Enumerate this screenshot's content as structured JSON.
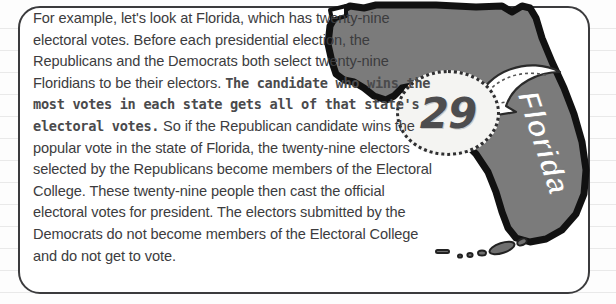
{
  "card": {
    "paragraph_lead": "For example, let's look at Florida, which has twenty-nine electoral votes. Before each presidential election, the Republicans and the Democrats both select twenty-nine Floridians to be their electors. ",
    "paragraph_emphasis": "The candidate who wins the most votes in each state gets all of that state's electoral votes.",
    "paragraph_tail": " So if the Republican candidate wins the popular vote in the state of Florida, the twenty-nine electors selected by the Republicans become members of the Electoral College. These twenty-nine people then cast the official electoral votes for president. The electors submitted by the Democrats do not become members of the Electoral College and do not get to vote."
  },
  "callout": {
    "electoral_votes": "29"
  },
  "map": {
    "state_label": "Florida",
    "fill_color": "#7b7b7b",
    "outline_color": "#111111",
    "label_color": "#ffffff",
    "arrow_color": "#ffffff"
  },
  "colors": {
    "text": "#3c3c3e",
    "emphasis_text": "#4a4a4c",
    "card_border": "#3b3b3d",
    "card_background": "#ffffff",
    "page_background": "#fdfdfd",
    "rule_line": "#e9e9e9",
    "callout_oval_fill": "#f4f4f2",
    "callout_number": "#4d4d4f"
  }
}
